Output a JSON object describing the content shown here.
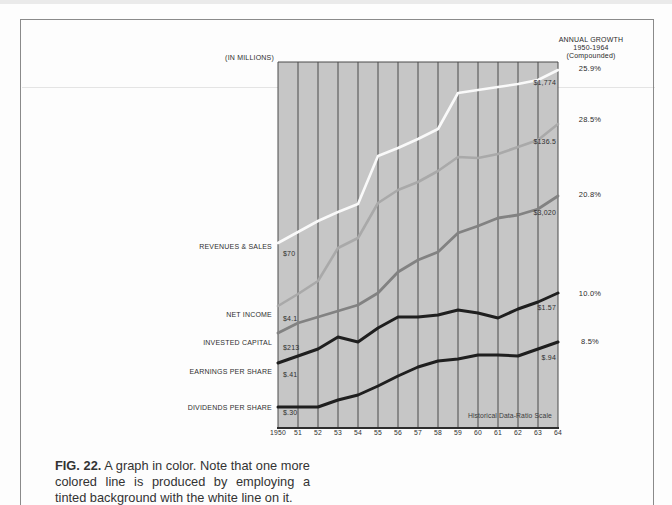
{
  "page": {
    "caption": {
      "label": "FIG. 22.",
      "text": "A graph in color. Note that one more colored line is produced by employing a tinted background with the white line on it."
    }
  },
  "chart": {
    "units_label": "(IN MILLIONS)",
    "right_header": {
      "line1": "ANNUAL GROWTH",
      "line2": "1950-1964",
      "line3": "(Compounded)"
    },
    "scale_note": "Historical Data-Ratio Scale",
    "x_labels": [
      "1950",
      "51",
      "52",
      "53",
      "54",
      "55",
      "56",
      "57",
      "58",
      "59",
      "60",
      "61",
      "62",
      "63",
      "64"
    ],
    "colors": {
      "plot_bg": "#c6c6c6",
      "gridline": "#4a4a4a",
      "axis": "#2e2e2e",
      "page_border": "#8a8a8a"
    },
    "geometry": {
      "left": 278,
      "right": 558,
      "top": 62,
      "bottom": 428,
      "dx": 20
    },
    "series": [
      {
        "id": "revenues-sales",
        "label": "REVENUES & SALES",
        "start_label": "$70",
        "end_label": "$1,774",
        "growth_label": "25.9%",
        "color": "#fafafa",
        "width": 2.6,
        "path_y": [
          243,
          232,
          221,
          212,
          204,
          156,
          148,
          139,
          129,
          93,
          90,
          87,
          84,
          80,
          70
        ],
        "label_y": {
          "name": 246,
          "start": 253,
          "end": 82,
          "growth": 69
        }
      },
      {
        "id": "net-income",
        "label": "NET INCOME",
        "start_label": "$4.1",
        "end_label": "$136.5",
        "growth_label": "28.5%",
        "color": "#a9a9a9",
        "width": 2.6,
        "path_y": [
          306,
          294,
          281,
          248,
          238,
          203,
          190,
          182,
          171,
          157,
          158,
          154,
          147,
          140,
          124
        ],
        "label_y": {
          "name": 314,
          "start": 318,
          "end": 141,
          "growth": 120
        }
      },
      {
        "id": "invested-capital",
        "label": "INVESTED CAPITAL",
        "start_label": "$213",
        "end_label": "$3,020",
        "growth_label": "20.8%",
        "color": "#828282",
        "width": 2.8,
        "path_y": [
          333,
          323,
          317,
          311,
          305,
          293,
          272,
          260,
          252,
          233,
          226,
          218,
          215,
          209,
          196
        ],
        "label_y": {
          "name": 342,
          "start": 347,
          "end": 212,
          "growth": 195
        }
      },
      {
        "id": "earnings-per-share",
        "label": "EARNINGS PER SHARE",
        "start_label": "$.41",
        "end_label": "$1.57",
        "growth_label": "10.0%",
        "color": "#1f1f1f",
        "width": 3,
        "path_y": [
          363,
          356,
          349,
          337,
          342,
          328,
          317,
          317,
          315,
          310,
          313,
          318,
          309,
          302,
          293
        ],
        "label_y": {
          "name": 371,
          "start": 374,
          "end": 307,
          "growth": 294
        }
      },
      {
        "id": "dividends-per-share",
        "label": "DIVIDENDS PER SHARE",
        "start_label": "$.30",
        "end_label": "$.94",
        "growth_label": "8.5%",
        "color": "#1f1f1f",
        "width": 3,
        "path_y": [
          407,
          407,
          407,
          400,
          395,
          386,
          376,
          367,
          361,
          359,
          355,
          355,
          356,
          349,
          342
        ],
        "label_y": {
          "name": 407,
          "start": 412,
          "end": 357,
          "growth": 342
        }
      }
    ]
  },
  "chart_data": {
    "type": "line",
    "title": "",
    "scale": "ratio scale (semi-logarithmic); each series plotted on its own ratio scale",
    "units": "(IN MILLIONS)",
    "footnote": "Historical Data-Ratio Scale",
    "right_column_title": "ANNUAL GROWTH 1950-1964 (Compounded)",
    "x": [
      "1950",
      "51",
      "52",
      "53",
      "54",
      "55",
      "56",
      "57",
      "58",
      "59",
      "60",
      "61",
      "62",
      "63",
      "64"
    ],
    "series": [
      {
        "name": "Revenues & Sales",
        "line_color": "white",
        "value_1950": 70,
        "value_1964": 1774,
        "annual_growth_compounded": "25.9%",
        "values_estimated": [
          70,
          86,
          106,
          125,
          145,
          356,
          413,
          489,
          590,
          1155,
          1225,
          1290,
          1365,
          1477,
          1774
        ]
      },
      {
        "name": "Net Income",
        "line_color": "light gray",
        "value_1950": 4.1,
        "value_1964": 136.5,
        "annual_growth_compounded": "28.5%",
        "values_estimated": [
          4.1,
          5.2,
          6.6,
          12.5,
          15.2,
          29.8,
          38.3,
          44.6,
          55.1,
          72.1,
          70.9,
          76.6,
          87.7,
          100,
          136.5
        ]
      },
      {
        "name": "Invested Capital",
        "line_color": "medium gray",
        "value_1950": 213,
        "value_1964": 3020,
        "annual_growth_compounded": "20.8%",
        "values_estimated": [
          213,
          258,
          290,
          326,
          366,
          462,
          692,
          875,
          1020,
          1476,
          1689,
          1970,
          2089,
          2343,
          3020
        ]
      },
      {
        "name": "Earnings Per Share",
        "line_color": "black",
        "value_1950": 0.41,
        "value_1964": 1.57,
        "annual_growth_compounded": "10.0%",
        "values_estimated": [
          0.41,
          0.47,
          0.54,
          0.68,
          0.61,
          0.8,
          0.99,
          0.99,
          1.03,
          1.14,
          1.07,
          0.97,
          1.16,
          1.32,
          1.57
        ]
      },
      {
        "name": "Dividends Per Share",
        "line_color": "black",
        "value_1950": 0.3,
        "value_1964": 0.94,
        "annual_growth_compounded": "8.5%",
        "values_estimated": [
          0.3,
          0.3,
          0.3,
          0.34,
          0.37,
          0.43,
          0.52,
          0.61,
          0.67,
          0.7,
          0.75,
          0.75,
          0.74,
          0.83,
          0.94
        ]
      }
    ]
  }
}
